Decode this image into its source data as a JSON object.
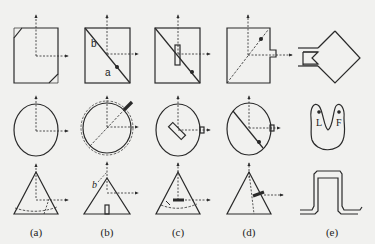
{
  "figure": {
    "columns": [
      {
        "id": "a",
        "caption": "(a)"
      },
      {
        "id": "b",
        "caption": "(b)",
        "annotations": {
          "square_upper": "b",
          "square_lower": "a",
          "triangle_side": "b"
        }
      },
      {
        "id": "c",
        "caption": "(c)"
      },
      {
        "id": "d",
        "caption": "(d)"
      },
      {
        "id": "e",
        "caption": "(e)",
        "annotations": {
          "heart_left": "L",
          "heart_right": "F"
        }
      }
    ],
    "rows": [
      "square",
      "ellipse",
      "triangle"
    ],
    "colors": {
      "stroke": "#2a2a2a",
      "background": "#f1f1ef"
    }
  }
}
